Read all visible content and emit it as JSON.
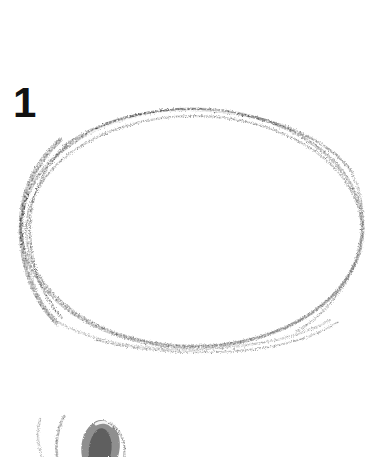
{
  "plate": {
    "label": "1",
    "medium": "graphite pencil on white paper",
    "background_color": "#ffffff",
    "width": 381,
    "height": 457
  },
  "strokes": {
    "ellipse": {
      "name": "hand-drawn ellipse outline",
      "center_x": 192,
      "center_y": 228,
      "radius_x": 172,
      "radius_y": 120,
      "stroke_color": "#2b2b2b",
      "light_stroke_color": "#8d8d8d",
      "doubled_at": "top and lower-left",
      "darkest_side": "left"
    },
    "bottom_sketches": [
      {
        "name": "thin crescent stroke left",
        "stroke_color": "#7a7a7a"
      },
      {
        "name": "thin crescent stroke right",
        "stroke_color": "#3c3c3c"
      },
      {
        "name": "shaded seed form",
        "fill_color": "#8a8a8a",
        "outline_color": "#2e2e2e",
        "highlight_color": "#f2f2f2"
      }
    ]
  }
}
